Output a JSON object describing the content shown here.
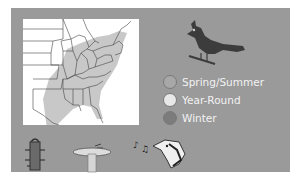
{
  "panel": {
    "background": "#9a9a9a"
  },
  "map": {
    "label": "Range map of eastern United States",
    "range_color": "#c8c8c8",
    "background": "#ffffff"
  },
  "bird": {
    "icon": "cardinal-silhouette-icon",
    "color": "#3c3c3c"
  },
  "legend": {
    "items": [
      {
        "label": "Spring/Summer",
        "color": "#a8a8a8"
      },
      {
        "label": "Year-Round",
        "color": "#e8e8e8"
      },
      {
        "label": "Winter",
        "color": "#7c7c7c"
      }
    ]
  },
  "habitat_icons": [
    {
      "name": "bird-feeder-icon"
    },
    {
      "name": "bird-bath-icon"
    },
    {
      "name": "singing-bird-icon"
    }
  ]
}
